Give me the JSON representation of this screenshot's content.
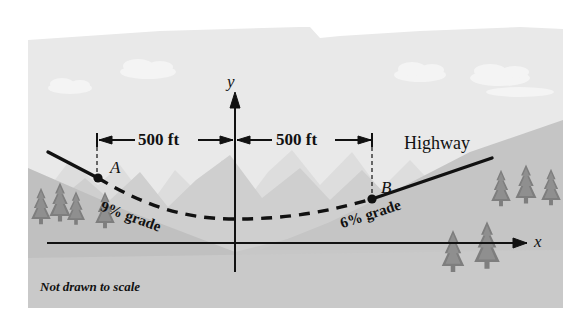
{
  "figure": {
    "title_note": "Not drawn to scale",
    "axes": {
      "y_label": "y",
      "x_label": "x"
    },
    "dimensions": [
      {
        "label": "500 ft",
        "side": "left"
      },
      {
        "label": "500 ft",
        "side": "right"
      }
    ],
    "points": [
      {
        "label": "A",
        "x_ft": -500
      },
      {
        "label": "B",
        "x_ft": 500
      }
    ],
    "grades": [
      {
        "label": "9% grade",
        "side": "left",
        "value_percent": 9
      },
      {
        "label": "6% grade",
        "side": "right",
        "value_percent": 6
      }
    ],
    "road_label": "Highway",
    "colors": {
      "sky": "#e9e9e9",
      "ground": "#c9c9c9",
      "mountain_far": "#dcdcdc",
      "mountain_near": "#c2c2c2",
      "hill_left": "#bdbdbd",
      "line": "#111111",
      "tree": "#8a8a8a",
      "cloud": "#f2f2f2",
      "paper": "#ffffff"
    }
  }
}
